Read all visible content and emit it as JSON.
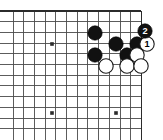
{
  "diagram": {
    "kind": "go-board-problem-diagram",
    "title": "Go corner sequence diagram",
    "board": {
      "line_color": "#4a4a4a",
      "edge_color": "#2b2b2b",
      "background_color": "#ffffff",
      "grid_spacing": 10.7,
      "origin_x": 13,
      "origin_y": 11,
      "columns": 13,
      "rows": 12,
      "right_edge_is_board_edge": true,
      "top_edge_is_board_edge": true,
      "left_cropped": true,
      "bottom_cropped": true
    },
    "star_points": [
      {
        "name": "star-point-upper-left",
        "x": 52,
        "y": 44
      },
      {
        "name": "star-point-lower-left",
        "x": 52,
        "y": 113
      },
      {
        "name": "star-point-lower-center",
        "x": 116,
        "y": 113
      }
    ],
    "stone_colors": {
      "black_fill": "#111111",
      "black_stroke": "#000000",
      "white_fill": "#ffffff",
      "white_stroke": "#1a1a1a",
      "black_label_text": "#ffffff",
      "white_label_text": "#000000"
    },
    "stone_radius": 7.2,
    "stones": [
      {
        "id": "black-a",
        "color": "black",
        "x": 95,
        "y": 33,
        "label": ""
      },
      {
        "id": "black-b",
        "color": "black",
        "x": 116,
        "y": 44,
        "label": ""
      },
      {
        "id": "black-c",
        "color": "black",
        "x": 137,
        "y": 44,
        "label": ""
      },
      {
        "id": "black-d",
        "color": "black",
        "x": 95,
        "y": 55,
        "label": ""
      },
      {
        "id": "black-e",
        "color": "black",
        "x": 127,
        "y": 55,
        "label": ""
      },
      {
        "id": "white-a",
        "color": "white",
        "x": 137,
        "y": 55,
        "label": ""
      },
      {
        "id": "white-b",
        "color": "white",
        "x": 106,
        "y": 66,
        "label": ""
      },
      {
        "id": "white-c",
        "color": "white",
        "x": 127,
        "y": 66,
        "label": ""
      },
      {
        "id": "white-d",
        "color": "white",
        "x": 141,
        "y": 66,
        "label": ""
      }
    ],
    "numbered_moves": [
      {
        "id": "move-1",
        "color": "white",
        "x": 147,
        "y": 44,
        "label": "1",
        "move_number": 1
      },
      {
        "id": "move-2",
        "color": "black",
        "x": 145,
        "y": 31,
        "label": "2",
        "move_number": 2
      }
    ],
    "caption": ""
  }
}
